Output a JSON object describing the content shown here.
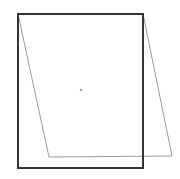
{
  "canvas": {
    "width": 180,
    "height": 179,
    "background": "#ffffff"
  },
  "shapes": {
    "rectangle": {
      "x": 18,
      "y": 14,
      "width": 125,
      "height": 154,
      "stroke": "#333333",
      "stroke_width": 2
    },
    "parallelogram": {
      "points": "18,14 143,14 172,156 49,157",
      "stroke": "#9a9a9a",
      "stroke_width": 1
    },
    "center_point": {
      "cx": 81,
      "cy": 90,
      "r": 1.2,
      "fill": "#a0a0a0"
    }
  }
}
